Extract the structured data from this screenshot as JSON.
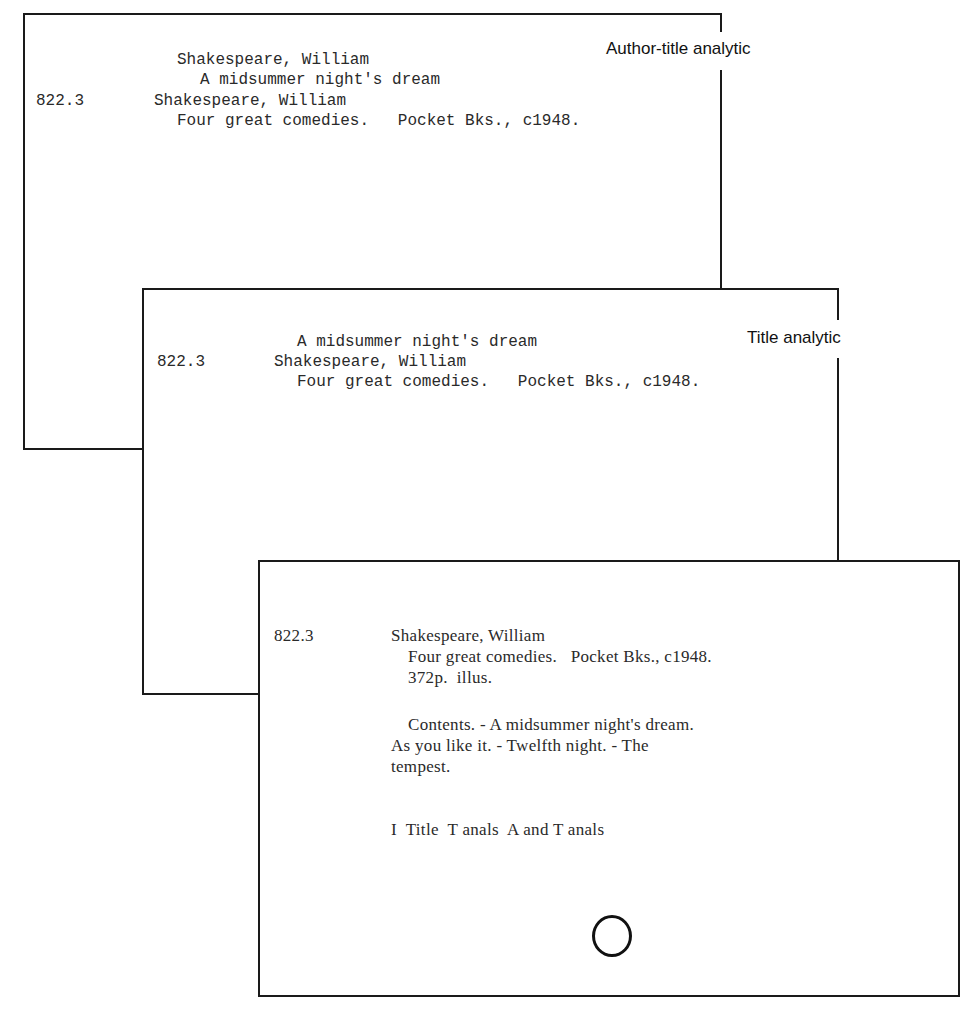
{
  "cards": [
    {
      "id": "author-title-analytic",
      "label": "Author-title analytic",
      "lines": {
        "heading_author": "Shakespeare, William",
        "heading_title": "A midsummer night's dream",
        "call_number": "822.3",
        "author": "Shakespeare, William",
        "title_imprint": "Four great comedies.   Pocket Bks., c1948."
      }
    },
    {
      "id": "title-analytic",
      "label": "Title analytic",
      "lines": {
        "heading_title": "A midsummer night's dream",
        "call_number": "822.3",
        "author": "Shakespeare, William",
        "title_imprint": "Four great comedies.   Pocket Bks., c1948."
      }
    },
    {
      "id": "main-entry",
      "lines": {
        "call_number": "822.3",
        "author": "Shakespeare, William",
        "title_imprint": "Four great comedies.   Pocket Bks., c1948.",
        "collation": "372p.  illus.",
        "contents_1": "Contents. - A midsummer night's dream.",
        "contents_2": "As you like it. - Twelfth night. - The",
        "contents_3": "tempest.",
        "tracing": "I  Title  T anals  A and T anals"
      },
      "hole_icon": "punch-hole"
    }
  ]
}
